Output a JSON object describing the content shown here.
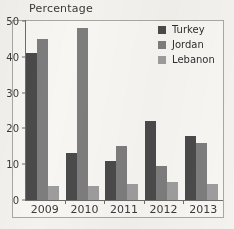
{
  "chart_data": {
    "type": "bar",
    "title": "",
    "ylabel": "Percentage",
    "xlabel": "",
    "categories": [
      "2009",
      "2010",
      "2011",
      "2012",
      "2013"
    ],
    "series": [
      {
        "name": "Turkey",
        "color": "#4a4a4a",
        "values": [
          41,
          13,
          11,
          22,
          18
        ]
      },
      {
        "name": "Jordan",
        "color": "#7d7d7d",
        "values": [
          45,
          48,
          15,
          9.5,
          16
        ]
      },
      {
        "name": "Lebanon",
        "color": "#9d9d9d",
        "values": [
          4,
          4,
          4.5,
          5,
          4.5
        ]
      }
    ],
    "ylim": [
      0,
      50
    ],
    "yticks": [
      0,
      10,
      20,
      30,
      40,
      50
    ],
    "ytick_labels": [
      "0",
      "10",
      "20",
      "30",
      "40",
      "50"
    ],
    "grid": false,
    "legend_position": "top-right"
  },
  "legend": {
    "items": [
      {
        "label": "Turkey"
      },
      {
        "label": "Jordan"
      },
      {
        "label": "Lebanon"
      }
    ]
  }
}
